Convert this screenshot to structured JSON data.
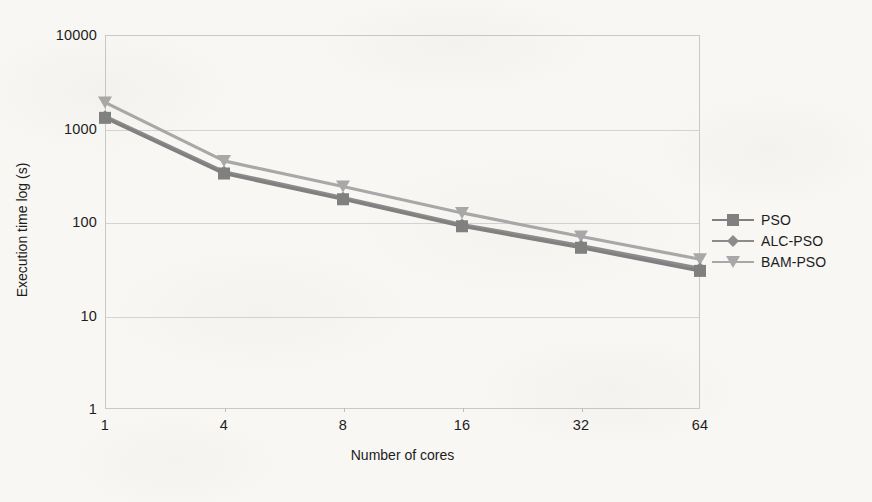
{
  "chart_data": {
    "type": "line",
    "title": "",
    "subtitle": "",
    "xlabel": "Number of cores",
    "ylabel": "Execution time log (s)",
    "x_categories": [
      "1",
      "4",
      "8",
      "16",
      "32",
      "64"
    ],
    "x_scale": "categorical",
    "y_scale": "log",
    "y_ticks": [
      "10000",
      "1000",
      "100",
      "10",
      "1"
    ],
    "ylim": [
      1,
      10000
    ],
    "grid": "horizontal",
    "legend_position": "right",
    "series": [
      {
        "name": "PSO",
        "color": "#808080",
        "marker": "square",
        "values": [
          1300,
          330,
          175,
          90,
          53,
          30
        ]
      },
      {
        "name": "ALC-PSO",
        "color": "#8c8c8c",
        "marker": "diamond",
        "values": [
          1350,
          345,
          182,
          94,
          56,
          32
        ]
      },
      {
        "name": "BAM-PSO",
        "color": "#a8a8a8",
        "marker": "triangle-down",
        "values": [
          1900,
          450,
          240,
          125,
          70,
          40
        ]
      }
    ]
  },
  "axes": {
    "y_title": "Execution time log (s)",
    "x_title": "Number of cores",
    "y_tick_labels": [
      "10000",
      "1000",
      "100",
      "10",
      "1"
    ],
    "x_tick_labels": [
      "1",
      "4",
      "8",
      "16",
      "32",
      "64"
    ]
  },
  "legend": {
    "items": [
      {
        "label": "PSO",
        "color": "#808080",
        "marker": "square"
      },
      {
        "label": "ALC-PSO",
        "color": "#8c8c8c",
        "marker": "diamond"
      },
      {
        "label": "BAM-PSO",
        "color": "#a8a8a8",
        "marker": "triangle-down"
      }
    ]
  },
  "colors": {
    "background": "#f8f7f4",
    "gridline": "#d3d3d3",
    "axis_frame": "#c9c9c9",
    "text": "#1c1c1c"
  }
}
